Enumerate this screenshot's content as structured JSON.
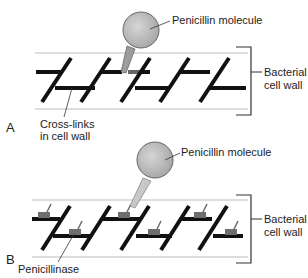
{
  "panels": [
    {
      "letter": "A",
      "labels": {
        "molecule": "Penicillin molecule",
        "wall_line1": "Bacterial",
        "wall_line2": "cell wall",
        "crosslinks_line1": "Cross-links",
        "crosslinks_line2": "in cell wall"
      }
    },
    {
      "letter": "B",
      "labels": {
        "molecule": "Penicillin molecule",
        "wall_line1": "Bacterial",
        "wall_line2": "cell wall",
        "enzyme": "Penicillinase"
      }
    }
  ],
  "colors": {
    "molecule_fill": "#b8b8b8",
    "strand": "#111111",
    "wall_line": "#bbbbbb",
    "enzyme": "#6e6e6e"
  }
}
